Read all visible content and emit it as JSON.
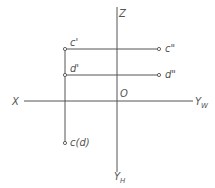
{
  "diagram": {
    "type": "orthographic-projection",
    "axes": {
      "z": "Z",
      "x": "X",
      "origin": "O",
      "yw": {
        "main": "Y",
        "sub": "W"
      },
      "yh": {
        "main": "Y",
        "sub": "H"
      }
    },
    "points": {
      "c_front": "c'",
      "c_side": "c\"",
      "d_front": "d'",
      "d_side": "d\"",
      "cd_top": "c(d)"
    }
  }
}
